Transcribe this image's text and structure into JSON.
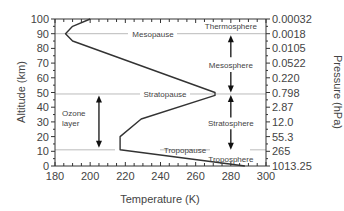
{
  "chart_data": {
    "type": "line",
    "title": "",
    "xlabel": "Temperature (K)",
    "ylabel": "Altitude (km)",
    "y2label": "Pressure (hPa)",
    "xlim": [
      180,
      300
    ],
    "ylim": [
      0,
      100
    ],
    "xticks": [
      180,
      200,
      220,
      240,
      260,
      280,
      300
    ],
    "yticks": [
      0,
      10,
      20,
      30,
      40,
      50,
      60,
      70,
      80,
      90,
      100
    ],
    "y2ticks": [
      "1013.25",
      "265",
      "55.3",
      "12.0",
      "2.87",
      "0.798",
      "0.220",
      "0.0522",
      "0.0105",
      "0.0018",
      "0.00032"
    ],
    "grid": false,
    "legend": null,
    "series": [
      {
        "name": "Temperature profile",
        "x": [
          288,
          217,
          217,
          229,
          271,
          271,
          190,
          186,
          190,
          200
        ],
        "y": [
          0,
          11,
          20,
          32,
          48,
          50,
          85,
          90,
          95,
          100
        ]
      }
    ],
    "boundaries": [
      {
        "label": "Tropopause",
        "altitude": 11
      },
      {
        "label": "Stratopause",
        "altitude": 49
      },
      {
        "label": "Mesopause",
        "altitude": 90
      }
    ],
    "layers": [
      {
        "label": "Troposphere",
        "from": 0,
        "to": 11
      },
      {
        "label": "Stratosphere",
        "from": 11,
        "to": 49
      },
      {
        "label": "Mesosphere",
        "from": 49,
        "to": 90
      },
      {
        "label": "Thermosphere",
        "from": 90,
        "to": 100
      }
    ],
    "annotations": [
      {
        "label": "Ozone layer",
        "from": 11,
        "to": 48,
        "x": 205
      }
    ]
  },
  "labels": {
    "xlabel": "Temperature (K)",
    "ylabel": "Altitude (km)",
    "y2label": "Pressure (hPa)",
    "ozone_line1": "Ozone",
    "ozone_line2": "layer",
    "tropopause": "Tropopause",
    "stratopause": "Stratopause",
    "mesopause": "Mesopause",
    "troposphere": "Troposphere",
    "stratosphere": "Stratosphere",
    "mesosphere": "Mesosphere",
    "thermosphere": "Thermosphere"
  }
}
